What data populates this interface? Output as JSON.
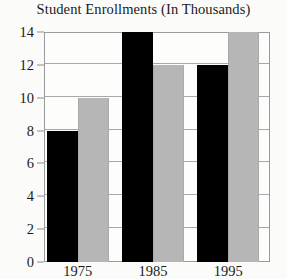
{
  "chart_data": {
    "type": "bar",
    "title": "Student Enrollments (In Thousands)",
    "xlabel": "",
    "ylabel": "",
    "categories": [
      "1975",
      "1985",
      "1995"
    ],
    "series": [
      {
        "name": "series-1",
        "color": "#000000",
        "values": [
          8,
          14,
          12
        ]
      },
      {
        "name": "series-2",
        "color": "#b6b6b6",
        "values": [
          10,
          12,
          14
        ]
      }
    ],
    "ylim": [
      0,
      14
    ],
    "ytick_labels": [
      "0",
      "2",
      "4",
      "6",
      "8",
      "10",
      "12",
      "14"
    ],
    "ytick_values": [
      0,
      2,
      4,
      6,
      8,
      10,
      12,
      14
    ],
    "grid": true,
    "legend": "none"
  },
  "colors": {
    "background": "#fbfbf9",
    "plot_background": "#fdfdfb",
    "axis": "#9a9a9a",
    "gridline": "#a8a8a8",
    "text": "#1b1b1b"
  }
}
